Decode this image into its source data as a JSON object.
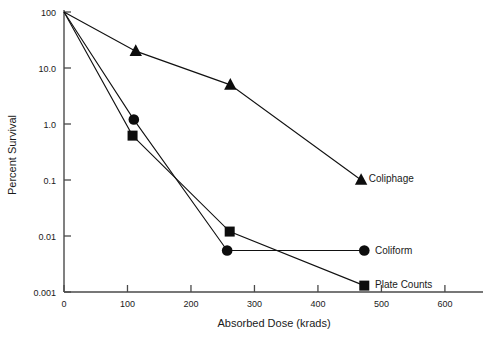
{
  "chart_data": {
    "type": "line",
    "title": "",
    "xlabel": "Absorbed Dose (krads)",
    "ylabel": "Percent Survival",
    "yscale": "log",
    "xlim": [
      0,
      660
    ],
    "ylim": [
      0.001,
      100
    ],
    "grid": false,
    "legend_position": "inline-right",
    "xticks": [
      "0",
      "100",
      "200",
      "300",
      "400",
      "500",
      "600"
    ],
    "xtick_values": [
      0,
      100,
      200,
      300,
      400,
      500,
      600
    ],
    "yticks": [
      "100",
      "10.0",
      "1.0",
      "0.1",
      "0.01",
      "0.001"
    ],
    "ytick_values": [
      100,
      10,
      1,
      0.1,
      0.01,
      0.001
    ],
    "series": [
      {
        "name": "Coliphage",
        "marker": "triangle",
        "x": [
          0,
          113,
          262,
          468
        ],
        "y": [
          100,
          20,
          5,
          0.1
        ]
      },
      {
        "name": "Coliform",
        "marker": "circle",
        "x": [
          0,
          110,
          257,
          473
        ],
        "y": [
          100,
          1.2,
          0.0055,
          0.0055
        ]
      },
      {
        "name": "Plate Counts",
        "marker": "square",
        "x": [
          0,
          108,
          261,
          473
        ],
        "y": [
          100,
          0.62,
          0.012,
          0.0013
        ]
      }
    ],
    "annotations": [
      {
        "text": "Coliphage",
        "x": 480,
        "y": 0.105
      },
      {
        "text": "Coliform",
        "x": 490,
        "y": 0.0055
      },
      {
        "text": "Plate Counts",
        "x": 490,
        "y": 0.00135
      }
    ]
  }
}
